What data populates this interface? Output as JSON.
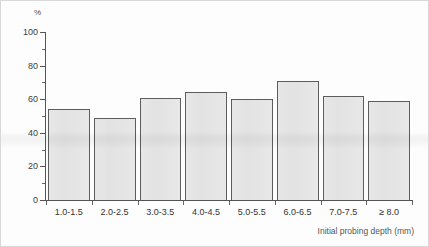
{
  "chart_data": {
    "type": "bar",
    "title": "",
    "subtitle": "",
    "xlabel": "Initial probing depth (mm)",
    "ylabel": "%",
    "ylim": [
      0,
      100
    ],
    "ytick_major": [
      0,
      20,
      40,
      60,
      80,
      100
    ],
    "ytick_minor": [
      10,
      30,
      50,
      70,
      90
    ],
    "ytick_labels": [
      "0",
      "20",
      "40",
      "60",
      "80",
      "100"
    ],
    "grid": false,
    "legend": null,
    "categories": [
      "1.0-1.5",
      "2.0-2.5",
      "3.0-3.5",
      "4.0-4.5",
      "5.0-5.5",
      "6.0-6.5",
      "7.0-7.5",
      "≥ 8.0"
    ],
    "values": [
      54,
      49,
      61,
      64,
      60,
      71,
      62,
      59
    ],
    "bar_fill_color": "#e2e2e2",
    "bar_border_color": "#5d5d5d",
    "axis_color": "#555555"
  }
}
